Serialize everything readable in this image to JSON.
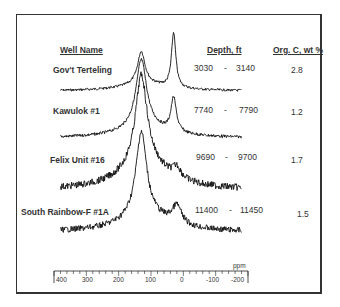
{
  "headers": {
    "well_name": "Well Name",
    "depth": "Depth, ft",
    "org_c": "Org. C, wt %"
  },
  "rows": [
    {
      "well": "Gov't Terteling",
      "depth_from": "3030",
      "dash": "-",
      "depth_to": "3140",
      "org_c": "2.8"
    },
    {
      "well": "Kawulok #1",
      "depth_from": "7740",
      "dash": "-",
      "depth_to": "7790",
      "org_c": "1.2"
    },
    {
      "well": "Felix Unit #16",
      "depth_from": "9690",
      "dash": "-",
      "depth_to": "9700",
      "org_c": "1.7"
    },
    {
      "well": "South Rainbow-F #1A",
      "depth_from": "11400",
      "dash": "-",
      "depth_to": "11450",
      "org_c": "1.5"
    }
  ],
  "axis": {
    "unit": "ppm",
    "ticks": [
      "400",
      "300",
      "200",
      "100",
      "0",
      "-100",
      "-200"
    ]
  },
  "chart_data": {
    "type": "line",
    "title": "",
    "xlabel": "ppm",
    "ylabel": "",
    "xlim": [
      400,
      -200
    ],
    "x_ticks": [
      400,
      300,
      200,
      100,
      0,
      -100,
      -200
    ],
    "grid": false,
    "series": [
      {
        "name": "Gov't Terteling",
        "depth_ft": "3030 - 3140",
        "org_c_wt_pct": 2.8,
        "peaks_ppm": [
          130,
          30
        ],
        "peak_rel_height": [
          0.6,
          1.0
        ]
      },
      {
        "name": "Kawulok #1",
        "depth_ft": "7740 - 7790",
        "org_c_wt_pct": 1.2,
        "peaks_ppm": [
          130,
          30
        ],
        "peak_rel_height": [
          1.0,
          0.55
        ]
      },
      {
        "name": "Felix Unit #16",
        "depth_ft": "9690 - 9700",
        "org_c_wt_pct": 1.7,
        "peaks_ppm": [
          130
        ],
        "peak_rel_height": [
          1.0
        ]
      },
      {
        "name": "South Rainbow-F #1A",
        "depth_ft": "11400 - 11450",
        "org_c_wt_pct": 1.5,
        "peaks_ppm": [
          130,
          20
        ],
        "peak_rel_height": [
          1.0,
          0.25
        ]
      }
    ]
  }
}
